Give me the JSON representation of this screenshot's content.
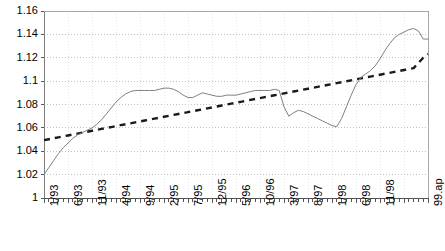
{
  "chart_data": {
    "type": "line",
    "title": "",
    "xlabel": "",
    "ylabel": "",
    "ylim": [
      1,
      1.16
    ],
    "yticks": [
      "1",
      "1.02",
      "1.04",
      "1.06",
      "1.08",
      "1.1",
      "1.12",
      "1.14",
      "1.16"
    ],
    "ytick_values": [
      1,
      1.02,
      1.04,
      1.06,
      1.08,
      1.1,
      1.12,
      1.14,
      1.16
    ],
    "grid": true,
    "grid_style": "dotted-horizontal-and-vertical",
    "legend": "none",
    "xtick_labels": [
      "1/93",
      "6/93",
      "11/93",
      "4/94",
      "9/94",
      "2/95",
      "7/95",
      "12/95",
      "5/96",
      "10/96",
      "3/97",
      "8/97",
      "1/98",
      "6/98",
      "11/98",
      "99.ap"
    ],
    "xtick_label_interval_months": 5,
    "x_minor_tick_interval_months": 1,
    "x_start": "1/93",
    "x_end": "99.apr",
    "n_points": 76,
    "series": [
      {
        "name": "index",
        "style": "solid",
        "color": "#808080",
        "values": [
          1.02,
          1.026,
          1.032,
          1.038,
          1.043,
          1.047,
          1.051,
          1.054,
          1.056,
          1.058,
          1.06,
          1.063,
          1.067,
          1.072,
          1.077,
          1.082,
          1.086,
          1.089,
          1.091,
          1.092,
          1.092,
          1.092,
          1.092,
          1.092,
          1.093,
          1.094,
          1.094,
          1.093,
          1.091,
          1.088,
          1.086,
          1.086,
          1.088,
          1.09,
          1.089,
          1.088,
          1.087,
          1.087,
          1.088,
          1.088,
          1.088,
          1.089,
          1.09,
          1.091,
          1.092,
          1.092,
          1.092,
          1.092,
          1.093,
          1.092,
          1.078,
          1.07,
          1.073,
          1.075,
          1.074,
          1.072,
          1.07,
          1.068,
          1.066,
          1.064,
          1.062,
          1.061,
          1.068,
          1.078,
          1.088,
          1.097,
          1.103,
          1.106,
          1.109,
          1.113,
          1.119,
          1.126,
          1.132,
          1.137,
          1.14,
          1.142,
          1.144,
          1.145,
          1.143,
          1.136,
          1.136
        ]
      },
      {
        "name": "trend",
        "style": "dashed",
        "color": "#1a1a1a",
        "values": [
          1.0495,
          1.0503,
          1.0511,
          1.0519,
          1.0527,
          1.0535,
          1.0543,
          1.0551,
          1.0559,
          1.0567,
          1.0575,
          1.0583,
          1.0591,
          1.0599,
          1.0607,
          1.0615,
          1.0623,
          1.0631,
          1.0639,
          1.0647,
          1.0655,
          1.0663,
          1.0671,
          1.0679,
          1.0687,
          1.0695,
          1.0703,
          1.0711,
          1.0719,
          1.0727,
          1.0735,
          1.0743,
          1.0751,
          1.0759,
          1.0767,
          1.0775,
          1.0783,
          1.0791,
          1.0799,
          1.0807,
          1.0815,
          1.0823,
          1.0831,
          1.0839,
          1.0847,
          1.0855,
          1.0863,
          1.0871,
          1.0879,
          1.0887,
          1.0895,
          1.0903,
          1.0911,
          1.0919,
          1.0927,
          1.0935,
          1.0943,
          1.0951,
          1.0959,
          1.0967,
          1.0975,
          1.0983,
          1.0991,
          1.0999,
          1.1007,
          1.1015,
          1.1023,
          1.1031,
          1.1039,
          1.1047,
          1.1055,
          1.1063,
          1.1071,
          1.1079,
          1.1087,
          1.1095,
          1.1103,
          1.1111,
          1.1155,
          1.12,
          1.1232
        ]
      }
    ]
  },
  "axes": {
    "plot_left": 44,
    "plot_right": 428,
    "plot_top": 11,
    "plot_bottom": 198
  }
}
